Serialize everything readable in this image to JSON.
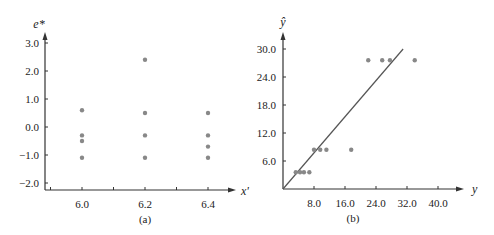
{
  "chart_data": [
    {
      "type": "scatter",
      "panel_label": "(a)",
      "xlabel": "x'",
      "ylabel": "e*",
      "x_ticks": [
        "6.0",
        "6.2",
        "6.4"
      ],
      "y_ticks": [
        "3.0",
        "2.0",
        "1.0",
        "0.0",
        "−1.0",
        "−2.0"
      ],
      "xlim": [
        5.9,
        6.5
      ],
      "ylim": [
        -2.2,
        3.2
      ],
      "grid": false,
      "points": [
        {
          "x": 6.0,
          "y": 0.6
        },
        {
          "x": 6.0,
          "y": -0.3
        },
        {
          "x": 6.0,
          "y": -0.5
        },
        {
          "x": 6.0,
          "y": -1.1
        },
        {
          "x": 6.2,
          "y": 2.4
        },
        {
          "x": 6.2,
          "y": 0.5
        },
        {
          "x": 6.2,
          "y": -0.3
        },
        {
          "x": 6.2,
          "y": -1.1
        },
        {
          "x": 6.4,
          "y": 0.5
        },
        {
          "x": 6.4,
          "y": -0.3
        },
        {
          "x": 6.4,
          "y": -0.7
        },
        {
          "x": 6.4,
          "y": -1.1
        }
      ]
    },
    {
      "type": "scatter",
      "panel_label": "(b)",
      "xlabel": "y",
      "ylabel": "ŷ",
      "x_ticks": [
        "8.0",
        "16.0",
        "24.0",
        "32.0",
        "40.0"
      ],
      "y_ticks": [
        "30.0",
        "24.0",
        "18.0",
        "12.0",
        "6.0"
      ],
      "xlim": [
        0,
        44
      ],
      "ylim": [
        0,
        32
      ],
      "grid": false,
      "reference_line": {
        "from": [
          0,
          0
        ],
        "to": [
          31,
          30
        ]
      },
      "points": [
        {
          "x": 3.3,
          "y": 3.6
        },
        {
          "x": 4.4,
          "y": 3.6
        },
        {
          "x": 5.4,
          "y": 3.6
        },
        {
          "x": 6.8,
          "y": 3.6
        },
        {
          "x": 8.0,
          "y": 8.4
        },
        {
          "x": 9.6,
          "y": 8.4
        },
        {
          "x": 11.2,
          "y": 8.4
        },
        {
          "x": 17.6,
          "y": 8.4
        },
        {
          "x": 22.0,
          "y": 27.6
        },
        {
          "x": 25.6,
          "y": 27.6
        },
        {
          "x": 27.6,
          "y": 27.6
        },
        {
          "x": 34.0,
          "y": 27.6
        }
      ]
    }
  ]
}
